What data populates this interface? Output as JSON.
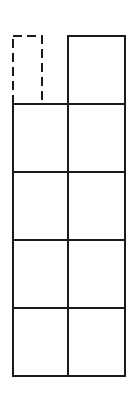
{
  "diagram": {
    "title": "",
    "colors": {
      "stroke": "#1a1a1a",
      "background": "#ffffff"
    },
    "grid": {
      "columns": 2,
      "rows": 4,
      "x": [
        13,
        68,
        125
      ],
      "y": [
        104,
        172,
        240,
        308,
        376
      ]
    },
    "top_cells": [
      {
        "column": 0,
        "style": "dashed",
        "x": 13,
        "y": 36,
        "width": 29,
        "height": 68
      },
      {
        "column": 1,
        "style": "solid",
        "x": 68,
        "y": 36,
        "width": 57,
        "height": 68
      }
    ]
  }
}
